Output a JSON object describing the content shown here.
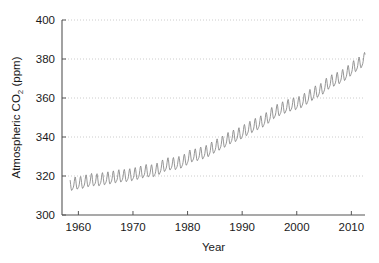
{
  "chart_data": {
    "type": "line",
    "title": "",
    "xlabel": "Year",
    "ylabel_parts": {
      "pre": "Atmospheric CO",
      "sub": "2",
      "post": " (ppm)"
    },
    "ylabel": "Atmospheric CO2 (ppm)",
    "xlim": [
      1957.0,
      2012.5
    ],
    "ylim": [
      300,
      400
    ],
    "xticks": [
      1960,
      1970,
      1980,
      1990,
      2000,
      2010
    ],
    "xtick_labels": [
      "1960",
      "1970",
      "1980",
      "1990",
      "2000",
      "2010"
    ],
    "yticks": [
      300,
      320,
      340,
      360,
      380,
      400
    ],
    "ytick_labels": [
      "300",
      "320",
      "340",
      "360",
      "380",
      "400"
    ],
    "grid": {
      "horizontal": true,
      "vertical": false,
      "style": "dotted",
      "color": "#bfbfbf"
    },
    "legend": null,
    "series": [
      {
        "name": "Monthly mean atmospheric CO2",
        "color": "#8a8a8a",
        "line_width": 0.9,
        "seasonal_amplitude_ppm": 3.0,
        "x": [
          1958.5,
          1959.0,
          1959.5,
          1960.0,
          1960.5,
          1961.0,
          1961.5,
          1962.0,
          1962.5,
          1963.0,
          1963.5,
          1964.0,
          1964.5,
          1965.0,
          1965.5,
          1966.0,
          1966.5,
          1967.0,
          1967.5,
          1968.0,
          1968.5,
          1969.0,
          1969.5,
          1970.0,
          1970.5,
          1971.0,
          1971.5,
          1972.0,
          1972.5,
          1973.0,
          1973.5,
          1974.0,
          1974.5,
          1975.0,
          1975.5,
          1976.0,
          1976.5,
          1977.0,
          1977.5,
          1978.0,
          1978.5,
          1979.0,
          1979.5,
          1980.0,
          1980.5,
          1981.0,
          1981.5,
          1982.0,
          1982.5,
          1983.0,
          1983.5,
          1984.0,
          1984.5,
          1985.0,
          1985.5,
          1986.0,
          1986.5,
          1987.0,
          1987.5,
          1988.0,
          1988.5,
          1989.0,
          1989.5,
          1990.0,
          1990.5,
          1991.0,
          1991.5,
          1992.0,
          1992.5,
          1993.0,
          1993.5,
          1994.0,
          1994.5,
          1995.0,
          1995.5,
          1996.0,
          1996.5,
          1997.0,
          1997.5,
          1998.0,
          1998.5,
          1999.0,
          1999.5,
          2000.0,
          2000.5,
          2001.0,
          2001.5,
          2002.0,
          2002.5,
          2003.0,
          2003.5,
          2004.0,
          2004.5,
          2005.0,
          2005.5,
          2006.0,
          2006.5,
          2007.0,
          2007.5,
          2008.0,
          2008.5,
          2009.0,
          2009.5,
          2010.0,
          2010.5,
          2011.0,
          2011.5,
          2012.0
        ],
        "annual_mean_values": [
          315.0,
          315.8,
          316.0,
          316.9,
          317.6,
          317.4,
          318.0,
          318.4,
          318.9,
          319.5,
          319.6,
          320.0,
          320.6,
          321.4,
          322.2,
          322.0,
          322.9,
          324.6,
          325.7,
          325.7,
          326.3,
          327.5,
          329.7,
          330.2,
          331.1,
          332.0,
          333.8,
          335.4,
          336.8,
          338.7,
          339.9,
          341.1,
          342.8,
          344.4,
          345.9,
          347.2,
          348.9,
          351.6,
          353.1,
          354.4,
          355.6,
          356.4,
          357.1,
          358.8,
          360.8,
          362.6,
          363.8,
          366.6,
          368.3,
          369.5,
          371.0,
          373.1,
          375.6,
          377.4,
          379.8,
          381.9,
          383.8,
          385.6,
          387.4,
          389.8,
          391.7,
          393.8
        ]
      }
    ],
    "data_source_description": "Monthly mean atmospheric carbon dioxide concentration showing long-term rise with annual seasonal cycle",
    "background_color": "#ffffff",
    "axis_color": "#555555"
  }
}
